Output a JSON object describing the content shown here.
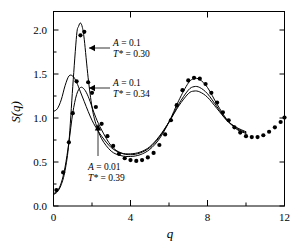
{
  "chart_data": {
    "type": "line",
    "title": "",
    "xlabel": "q",
    "ylabel": "S(q)",
    "xlim": [
      0,
      12
    ],
    "ylim": [
      0.0,
      2.2
    ],
    "grid": false,
    "legend_position": "inline-annotations",
    "x_ticks_major": [
      0,
      4,
      8,
      12
    ],
    "x_tick_labels": [
      "0",
      "4",
      "8",
      "12"
    ],
    "x_ticks_minor": [
      2,
      6,
      10
    ],
    "y_ticks_major": [
      0.0,
      0.5,
      1.0,
      1.5,
      2.0
    ],
    "y_tick_labels": [
      "0.0",
      "0.5",
      "1.0",
      "1.5",
      "2.0"
    ],
    "series": [
      {
        "name": "A = 0.1, T* = 0.30",
        "style": "line",
        "x": [
          0.0,
          0.2,
          0.4,
          0.6,
          0.8,
          1.0,
          1.2,
          1.3,
          1.4,
          1.5,
          1.6,
          1.8,
          2.0,
          2.2,
          2.5,
          3.0,
          3.5,
          4.0,
          4.5,
          5.0,
          5.5,
          6.0,
          6.5,
          7.0,
          7.3,
          7.6,
          8.0,
          8.5,
          9.0,
          9.5,
          10.0
        ],
        "y": [
          0.13,
          0.16,
          0.24,
          0.4,
          0.72,
          1.35,
          1.93,
          2.03,
          2.07,
          2.02,
          1.88,
          1.45,
          1.12,
          0.93,
          0.76,
          0.62,
          0.57,
          0.56,
          0.58,
          0.64,
          0.76,
          0.95,
          1.19,
          1.39,
          1.44,
          1.43,
          1.34,
          1.15,
          0.98,
          0.87,
          0.82
        ]
      },
      {
        "name": "A = 0.1, T* = 0.34",
        "style": "line",
        "x": [
          0.0,
          0.2,
          0.4,
          0.6,
          0.8,
          1.0,
          1.2,
          1.4,
          1.6,
          1.8,
          2.0,
          2.2,
          2.5,
          3.0,
          3.5,
          4.0,
          4.5,
          5.0,
          5.5,
          6.0,
          6.5,
          7.0,
          7.3,
          7.6,
          8.0,
          8.5,
          9.0,
          9.5,
          10.0
        ],
        "y": [
          0.14,
          0.17,
          0.26,
          0.44,
          0.72,
          1.05,
          1.26,
          1.34,
          1.32,
          1.24,
          1.12,
          1.0,
          0.86,
          0.68,
          0.6,
          0.58,
          0.6,
          0.66,
          0.78,
          0.95,
          1.15,
          1.31,
          1.35,
          1.34,
          1.27,
          1.12,
          0.97,
          0.88,
          0.83
        ]
      },
      {
        "name": "A = 0.01, T* = 0.39",
        "style": "line",
        "x": [
          0.0,
          0.2,
          0.4,
          0.6,
          0.8,
          1.0,
          1.2,
          1.4,
          1.6,
          1.8,
          2.0,
          2.2,
          2.5,
          3.0,
          3.5,
          4.0,
          4.5,
          5.0,
          5.5,
          6.0,
          6.5,
          7.0,
          7.3,
          7.6,
          8.0,
          8.5,
          9.0,
          9.5,
          10.0
        ],
        "y": [
          1.07,
          1.1,
          1.2,
          1.36,
          1.47,
          1.47,
          1.4,
          1.29,
          1.18,
          1.07,
          0.97,
          0.89,
          0.79,
          0.66,
          0.6,
          0.59,
          0.61,
          0.67,
          0.79,
          0.95,
          1.13,
          1.27,
          1.3,
          1.29,
          1.23,
          1.1,
          0.97,
          0.89,
          0.84
        ]
      },
      {
        "name": "simulation-data",
        "style": "points",
        "marker": "filled-circle",
        "x": [
          0.15,
          0.5,
          0.8,
          1.0,
          1.2,
          1.4,
          1.6,
          1.8,
          2.0,
          2.2,
          2.5,
          2.8,
          3.1,
          3.4,
          3.7,
          4.0,
          4.3,
          4.6,
          4.9,
          5.2,
          5.5,
          5.8,
          6.1,
          6.4,
          6.7,
          7.0,
          7.3,
          7.6,
          7.9,
          8.2,
          8.5,
          8.8,
          9.1,
          9.4,
          9.7,
          10.0,
          10.3,
          10.6,
          10.9,
          11.2,
          11.5,
          11.8,
          12.0
        ],
        "y": [
          0.18,
          0.38,
          0.72,
          1.05,
          1.41,
          1.93,
          1.97,
          1.4,
          1.28,
          1.12,
          0.93,
          0.79,
          0.68,
          0.59,
          0.54,
          0.52,
          0.51,
          0.52,
          0.55,
          0.6,
          0.69,
          0.81,
          0.97,
          1.14,
          1.31,
          1.42,
          1.45,
          1.44,
          1.38,
          1.28,
          1.17,
          1.06,
          0.97,
          0.89,
          0.83,
          0.79,
          0.78,
          0.78,
          0.8,
          0.84,
          0.89,
          0.95,
          1.0
        ]
      }
    ],
    "annotations": [
      {
        "id": "annot-1",
        "line1_var": "A",
        "line1_eq": " = 0.1",
        "line2_var": "T*",
        "line2_eq": " = 0.30",
        "pointer": "arrow-left"
      },
      {
        "id": "annot-2",
        "line1_var": "A",
        "line1_eq": " = 0.1",
        "line2_var": "T*",
        "line2_eq": " = 0.34",
        "pointer": "arrow-left"
      },
      {
        "id": "annot-3",
        "line1_var": "A",
        "line1_eq": " = 0.01",
        "line2_var": "T*",
        "line2_eq": " = 0.39",
        "pointer": "arrow-up"
      }
    ],
    "colors": {
      "background": "#ffffff",
      "axis": "#000000",
      "curve": "#000000",
      "marker": "#000000"
    }
  }
}
